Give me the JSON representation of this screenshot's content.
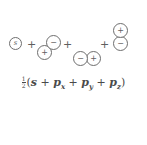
{
  "diagram": {
    "stroke_color": "#6e6e6e",
    "text_color": "#5f5f5f",
    "background": "#ffffff",
    "terms": [
      {
        "id": "s",
        "label": "s",
        "type": "s-orbital",
        "lobes": [
          {
            "sign": "s"
          }
        ]
      },
      {
        "id": "px",
        "label": "px",
        "type": "p-orbital",
        "orientation": "diagonal",
        "lobes": [
          {
            "sign": "−",
            "position": "upper-right"
          },
          {
            "sign": "+",
            "position": "lower-left"
          }
        ]
      },
      {
        "id": "py",
        "label": "py",
        "type": "p-orbital",
        "orientation": "horizontal",
        "lobes": [
          {
            "sign": "−",
            "position": "left"
          },
          {
            "sign": "+",
            "position": "right"
          }
        ]
      },
      {
        "id": "pz",
        "label": "pz",
        "type": "p-orbital",
        "orientation": "vertical",
        "lobes": [
          {
            "sign": "+",
            "position": "top"
          },
          {
            "sign": "−",
            "position": "bottom"
          }
        ]
      }
    ],
    "operators": {
      "plus": "+"
    }
  },
  "formula": {
    "coefficient": {
      "numerator": "1",
      "denominator": "2"
    },
    "open_paren": "(",
    "close_paren": ")",
    "plus": "+",
    "terms": [
      {
        "base": "s",
        "subscript": ""
      },
      {
        "base": "p",
        "subscript": "x"
      },
      {
        "base": "p",
        "subscript": "y"
      },
      {
        "base": "p",
        "subscript": "z"
      }
    ],
    "text": "1/2 (s + px + py + pz)"
  }
}
